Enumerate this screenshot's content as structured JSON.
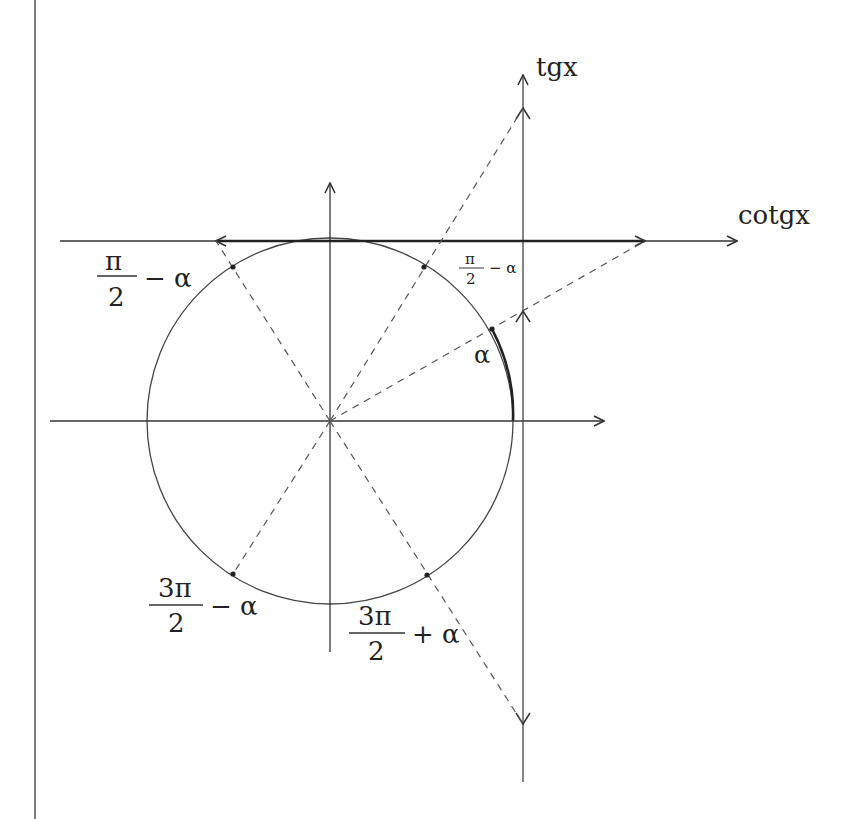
{
  "diagram": {
    "type": "trigonometric unit circle with tangent and cotangent axes",
    "axes": {
      "tangent_label": "tgx",
      "cotangent_label": "cotgx"
    },
    "angle_labels": {
      "alpha": "α",
      "pi_half_minus_alpha_small": {
        "num": "π",
        "den": "2",
        "suffix": "− α"
      },
      "pi_half_minus_alpha_left": {
        "num": "π",
        "den": "2",
        "suffix": "− α"
      },
      "three_pi_half_minus_alpha": {
        "num": "3π",
        "den": "2",
        "suffix": "− α"
      },
      "three_pi_half_plus_alpha": {
        "num": "3π",
        "den": "2",
        "suffix": "+ α"
      }
    },
    "colors": {
      "line": "#333333",
      "dashed": "#555555",
      "background": "#ffffff"
    }
  }
}
